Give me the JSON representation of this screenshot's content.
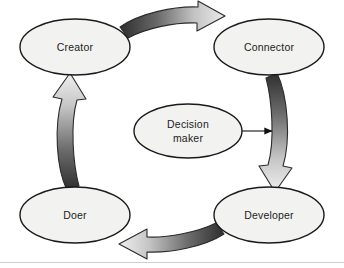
{
  "diagram": {
    "background_color": "#ffffff",
    "node_fill": "#f2f2f0",
    "node_stroke": "#1a1a1a",
    "arrow_dark": "#3a3a3a",
    "arrow_light": "#e6e6e6",
    "nodes": [
      {
        "id": "creator",
        "label": "Creator",
        "cx": 75,
        "cy": 47,
        "rx": 55,
        "ry": 28
      },
      {
        "id": "connector",
        "label": "Connector",
        "cx": 269,
        "cy": 47,
        "rx": 55,
        "ry": 28
      },
      {
        "id": "developer",
        "label": "Developer",
        "cx": 269,
        "cy": 215,
        "rx": 55,
        "ry": 28
      },
      {
        "id": "doer",
        "label": "Doer",
        "cx": 75,
        "cy": 215,
        "rx": 55,
        "ry": 28
      },
      {
        "id": "decision-maker",
        "label_line1": "Decision",
        "label_line2": "maker",
        "cx": 188,
        "cy": 131,
        "rx": 54,
        "ry": 27
      }
    ],
    "arrows": [
      {
        "id": "creator-to-connector",
        "from": "creator",
        "to": "connector",
        "direction": "right",
        "style": "curved-block",
        "gradient": "dark-to-light"
      },
      {
        "id": "connector-to-developer",
        "from": "connector",
        "to": "developer",
        "direction": "down",
        "style": "curved-block",
        "gradient": "dark-to-light"
      },
      {
        "id": "developer-to-doer",
        "from": "developer",
        "to": "doer",
        "direction": "left",
        "style": "curved-block",
        "gradient": "dark-to-light"
      },
      {
        "id": "doer-to-creator",
        "from": "doer",
        "to": "creator",
        "direction": "up",
        "style": "curved-block",
        "gradient": "dark-to-light"
      },
      {
        "id": "decision-maker-to-cycle",
        "from": "decision-maker",
        "to": "connector-to-developer",
        "direction": "right",
        "style": "thin-line"
      }
    ]
  }
}
